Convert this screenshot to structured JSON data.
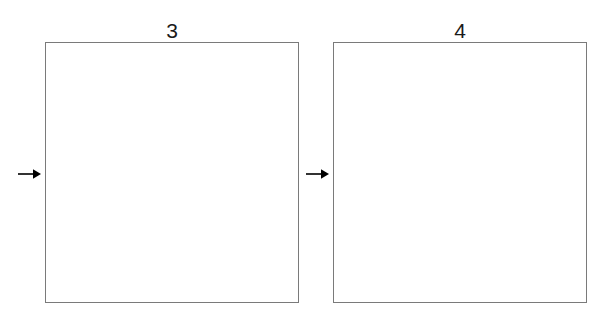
{
  "canvas": {
    "width": 616,
    "height": 318,
    "background_color": "#ffffff"
  },
  "style": {
    "box_border_color": "#7a7a7a",
    "box_fill_color": "#ffffff",
    "label_color": "#1a1a1a",
    "arrow_color": "#000000"
  },
  "panels": [
    {
      "label": "3",
      "arrow_icon": "arrow-right-icon",
      "box_fill": "#ffffff"
    },
    {
      "label": "4",
      "arrow_icon": "arrow-right-icon",
      "box_fill": "#ffffff"
    }
  ]
}
